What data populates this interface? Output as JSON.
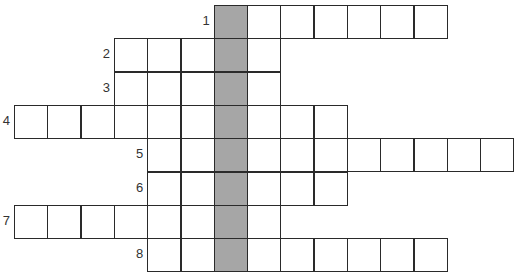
{
  "puzzle": {
    "type": "crossword",
    "cell_size": 33.3,
    "origin_x": 14,
    "origin_y": 5,
    "shaded_column": 6,
    "shaded_color": "#a6a6a6",
    "rows": [
      {
        "number": "1",
        "start_col": 6,
        "length": 7
      },
      {
        "number": "2",
        "start_col": 3,
        "length": 5
      },
      {
        "number": "3",
        "start_col": 3,
        "length": 5
      },
      {
        "number": "4",
        "start_col": 0,
        "length": 10
      },
      {
        "number": "5",
        "start_col": 4,
        "length": 11
      },
      {
        "number": "6",
        "start_col": 4,
        "length": 6
      },
      {
        "number": "7",
        "start_col": 0,
        "length": 8
      },
      {
        "number": "8",
        "start_col": 4,
        "length": 9
      }
    ]
  }
}
